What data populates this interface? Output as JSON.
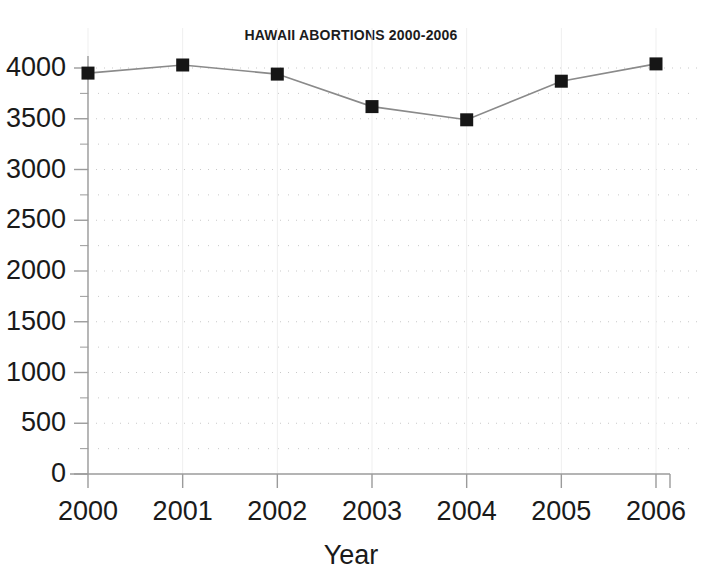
{
  "chart_data": {
    "type": "line",
    "title": "HAWAII ABORTIONS 2000-2006",
    "xlabel": "Year",
    "ylabel": "",
    "categories": [
      "2000",
      "2001",
      "2002",
      "2003",
      "2004",
      "2005",
      "2006"
    ],
    "x": [
      2000,
      2001,
      2002,
      2003,
      2004,
      2005,
      2006
    ],
    "values": [
      3950,
      4030,
      3940,
      3620,
      3490,
      3870,
      4040
    ],
    "series": [
      {
        "name": "Abortions",
        "values": [
          3950,
          4030,
          3940,
          3620,
          3490,
          3870,
          4040
        ]
      }
    ],
    "ylim": [
      0,
      4000
    ],
    "xlim": [
      2000,
      2006
    ],
    "ytick_labels": [
      "0",
      "500",
      "1000",
      "1500",
      "2000",
      "2500",
      "3000",
      "3500",
      "4000"
    ],
    "ytick_values": [
      0,
      500,
      1000,
      1500,
      2000,
      2500,
      3000,
      3500,
      4000
    ],
    "yminor_step": 250,
    "xtick_labels": [
      "2000",
      "2001",
      "2002",
      "2003",
      "2004",
      "2005",
      "2006"
    ],
    "grid": "horizontal-dotted-minor",
    "legend": "none",
    "marker": "filled-square",
    "line_color": "#8a8a8a",
    "marker_color": "#161616",
    "grid_color": "#c9c9c9",
    "axis_color": "#9b9b9b",
    "text_color": "#1a1a1a",
    "background": "#ffffff"
  }
}
